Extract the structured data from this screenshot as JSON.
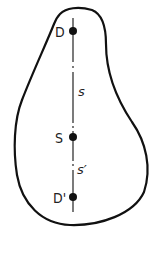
{
  "figure": {
    "points": [
      {
        "label": "D",
        "x": 73,
        "y": 31
      },
      {
        "label": "S",
        "x": 73,
        "y": 137
      },
      {
        "label": "D'",
        "x": 73,
        "y": 197
      }
    ],
    "segments": [
      {
        "label": "s",
        "from": "D",
        "to": "S"
      },
      {
        "label": "s′",
        "from": "S",
        "to": "D'"
      }
    ],
    "labels": {
      "D": "D",
      "S": "S",
      "D_prime": "D'",
      "s": "s",
      "s_prime": "s′"
    },
    "colors": {
      "stroke": "#111111",
      "background": "#ffffff"
    }
  }
}
